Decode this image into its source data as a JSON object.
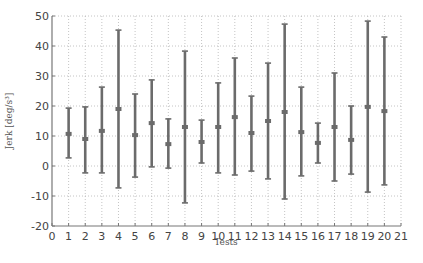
{
  "chart_data": {
    "type": "errorbar",
    "title": "",
    "xlabel": "Tests",
    "ylabel": "Jerk [deg/s³]",
    "xlim": [
      0,
      21
    ],
    "ylim": [
      -20,
      50
    ],
    "xticks": [
      0,
      1,
      2,
      3,
      4,
      5,
      6,
      7,
      8,
      9,
      10,
      11,
      12,
      13,
      14,
      15,
      16,
      17,
      18,
      19,
      20,
      21
    ],
    "yticks": [
      -20,
      -10,
      0,
      10,
      20,
      30,
      40,
      50
    ],
    "grid": true,
    "legend": null,
    "categories": [
      1,
      2,
      3,
      4,
      5,
      6,
      7,
      8,
      9,
      10,
      11,
      12,
      13,
      14,
      15,
      16,
      17,
      18,
      19,
      20
    ],
    "series": [
      {
        "name": "mean",
        "values": [
          10.7,
          9.0,
          11.7,
          19.0,
          10.3,
          14.3,
          7.3,
          13.0,
          8.0,
          13.0,
          16.3,
          11.0,
          15.0,
          18.0,
          11.3,
          7.7,
          13.0,
          8.7,
          19.7,
          18.3
        ]
      },
      {
        "name": "upper",
        "values": [
          19.3,
          19.7,
          26.3,
          45.3,
          24.0,
          28.7,
          15.7,
          38.3,
          15.3,
          27.7,
          36.0,
          23.3,
          34.3,
          47.3,
          26.3,
          14.3,
          31.0,
          20.0,
          48.3,
          43.0
        ]
      },
      {
        "name": "lower",
        "values": [
          2.7,
          -2.3,
          -2.3,
          -7.3,
          -3.7,
          -0.3,
          -0.7,
          -12.3,
          1.0,
          -2.3,
          -3.0,
          -1.7,
          -4.3,
          -11.0,
          -3.3,
          1.0,
          -5.0,
          -2.7,
          -8.7,
          -6.3
        ]
      }
    ],
    "colors": {
      "bar": "#6b6b6b",
      "axis": "#777777",
      "grid": "#b5b5b5"
    }
  }
}
